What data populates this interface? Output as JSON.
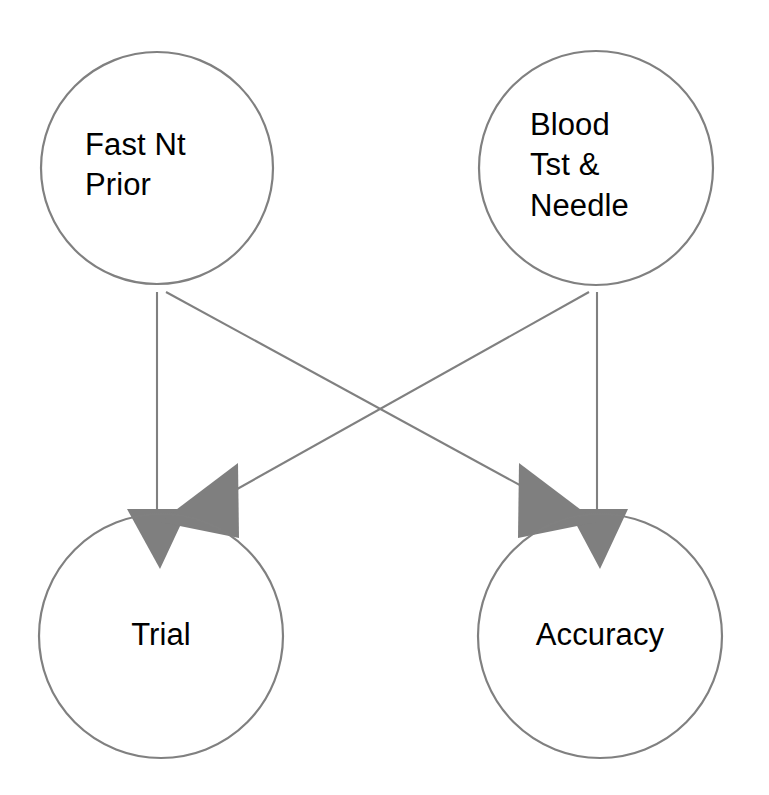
{
  "diagram": {
    "type": "path-diagram",
    "title": "",
    "background_color": "#ffffff",
    "stroke_color": "#808080",
    "arrowhead_color": "#7f7f7f",
    "text_color": "#000000",
    "nodes": [
      {
        "id": "fast-nt-prior",
        "label": "Fast Nt\nPrior",
        "label_line_1": "Fast Nt",
        "label_line_2": "Prior",
        "shape": "circle",
        "cx": 157,
        "cy": 168,
        "r": 116,
        "role": "exogenous"
      },
      {
        "id": "blood-tst-needle",
        "label": "Blood\nTst &\nNeedle",
        "label_line_1": "Blood",
        "label_line_2": "Tst &",
        "label_line_3": "Needle",
        "shape": "circle",
        "cx": 596,
        "cy": 168,
        "r": 116,
        "role": "exogenous"
      },
      {
        "id": "trial",
        "label": "Trial",
        "shape": "circle",
        "cx": 161,
        "cy": 636,
        "r": 121,
        "role": "endogenous"
      },
      {
        "id": "accuracy",
        "label": "Accuracy",
        "shape": "circle",
        "cx": 600,
        "cy": 636,
        "r": 121,
        "role": "endogenous"
      }
    ],
    "edges": [
      {
        "id": "edge-fast-nt-prior-to-trial",
        "from": "fast-nt-prior",
        "to": "trial",
        "style": "straight-vertical",
        "arrow": "single"
      },
      {
        "id": "edge-fast-nt-prior-to-accuracy",
        "from": "fast-nt-prior",
        "to": "accuracy",
        "style": "straight-diagonal",
        "arrow": "single"
      },
      {
        "id": "edge-blood-tst-needle-to-accuracy",
        "from": "blood-tst-needle",
        "to": "accuracy",
        "style": "straight-vertical",
        "arrow": "single"
      },
      {
        "id": "edge-blood-tst-needle-to-trial",
        "from": "blood-tst-needle",
        "to": "trial",
        "style": "straight-diagonal",
        "arrow": "single"
      }
    ]
  }
}
